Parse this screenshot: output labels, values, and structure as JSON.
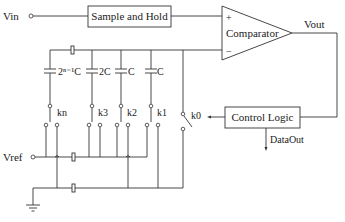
{
  "diagram": {
    "type": "successive-approximation ADC (capacitor array)",
    "inputs": {
      "vin": "Vin",
      "vref": "Vref"
    },
    "blocks": {
      "sample_hold": "Sample and Hold",
      "comparator": "Comparator",
      "control_logic": "Control Logic"
    },
    "comparator_pins": {
      "plus": "+",
      "minus": "−"
    },
    "outputs": {
      "vout": "Vout",
      "dataout": "DataOut"
    },
    "capacitors": [
      {
        "label": "2ⁿ⁻¹C"
      },
      {
        "label": "2C"
      },
      {
        "label": "C"
      },
      {
        "label": "C"
      }
    ],
    "switches": [
      {
        "label": "kn"
      },
      {
        "label": "k3"
      },
      {
        "label": "k2"
      },
      {
        "label": "k1"
      },
      {
        "label": "k0"
      }
    ]
  }
}
